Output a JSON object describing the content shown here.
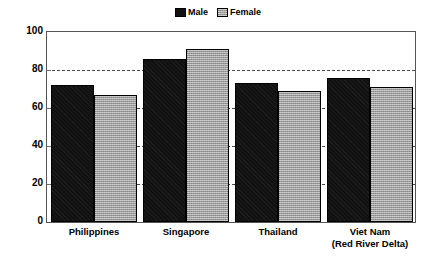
{
  "chart_data": {
    "type": "bar",
    "title": "",
    "subtitle": "",
    "xlabel": "",
    "ylabel": "",
    "ylim": [
      0,
      100
    ],
    "yticks": [
      0,
      20,
      40,
      60,
      80,
      100
    ],
    "ytick_labels": [
      "0",
      "20",
      "40",
      "60",
      "80",
      "100"
    ],
    "grid": "horizontal dashed gridlines at each y-tick inside plot area",
    "legend_position": "top-center",
    "categories": [
      "Philippines",
      "Singapore",
      "Thailand",
      "Viet Nam (Red River Delta)"
    ],
    "category_lines": [
      [
        "Philippines"
      ],
      [
        "Singapore"
      ],
      [
        "Thailand"
      ],
      [
        "Viet Nam",
        "(Red River Delta)"
      ]
    ],
    "series": [
      {
        "name": "Male",
        "color": "#111111",
        "values": [
          72,
          86,
          73,
          76
        ]
      },
      {
        "name": "Female",
        "color": "#9a9a9a",
        "values": [
          67,
          91,
          69,
          71
        ]
      }
    ],
    "annotations": []
  },
  "legend": {
    "entries": [
      {
        "label": "Male",
        "swatch": "male-swatch-icon"
      },
      {
        "label": "Female",
        "swatch": "female-swatch-icon"
      }
    ]
  },
  "colors": {
    "male_bar": "#111111",
    "female_bar": "#9a9a9a",
    "axis": "#555555",
    "gridline": "#4a4a4a",
    "background": "#ffffff",
    "text": "#000000"
  }
}
